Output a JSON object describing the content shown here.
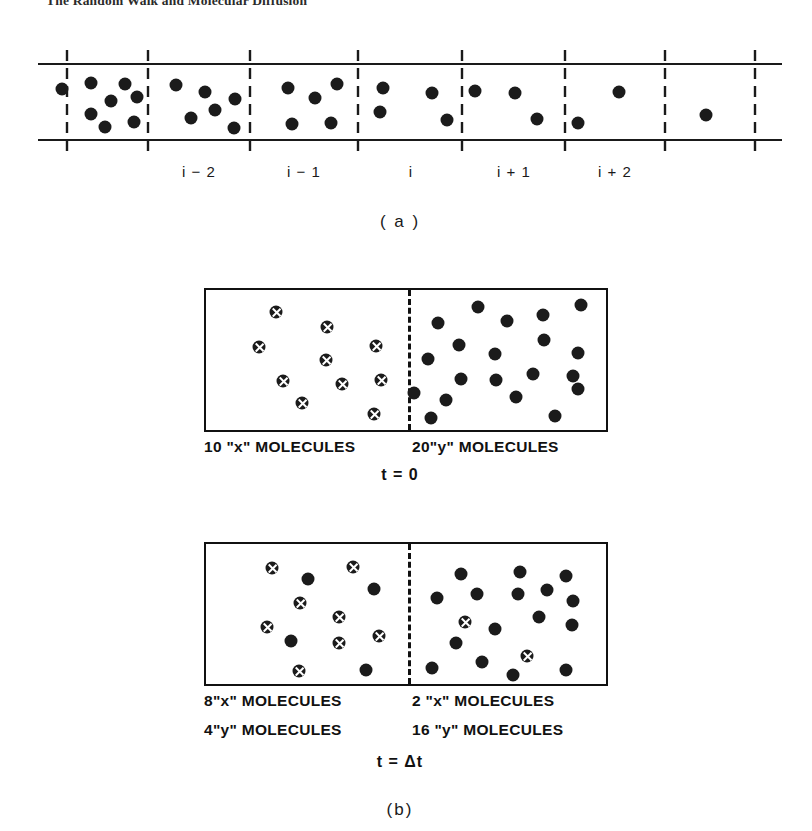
{
  "header": {
    "running_title": "The Random Walk and Molecular Diffusion"
  },
  "figure": {
    "panel_a": {
      "caption": "( a )",
      "caption_x": 400,
      "caption_y": 212,
      "channel": {
        "top_rail_y": 64,
        "bottom_rail_y": 140,
        "x_start": 38,
        "x_end": 782,
        "divider_x": [
          67,
          148,
          250,
          358,
          462,
          565,
          665,
          755
        ],
        "divider_top_y": 50,
        "divider_bottom_y": 155
      },
      "cell_labels": [
        {
          "text": "i − 2",
          "x": 199,
          "y": 163
        },
        {
          "text": "i − 1",
          "x": 304,
          "y": 163
        },
        {
          "text": "i",
          "x": 411,
          "y": 163
        },
        {
          "text": "i + 1",
          "x": 514,
          "y": 163
        },
        {
          "text": "i + 2",
          "x": 615,
          "y": 163
        }
      ],
      "dots": [
        {
          "x": 62,
          "y": 89
        },
        {
          "x": 91,
          "y": 83
        },
        {
          "x": 125,
          "y": 84
        },
        {
          "x": 111,
          "y": 101
        },
        {
          "x": 137,
          "y": 97
        },
        {
          "x": 91,
          "y": 114
        },
        {
          "x": 105,
          "y": 127
        },
        {
          "x": 134,
          "y": 122
        },
        {
          "x": 176,
          "y": 85
        },
        {
          "x": 205,
          "y": 92
        },
        {
          "x": 235,
          "y": 99
        },
        {
          "x": 191,
          "y": 118
        },
        {
          "x": 215,
          "y": 110
        },
        {
          "x": 234,
          "y": 128
        },
        {
          "x": 288,
          "y": 88
        },
        {
          "x": 337,
          "y": 84
        },
        {
          "x": 315,
          "y": 98
        },
        {
          "x": 292,
          "y": 124
        },
        {
          "x": 331,
          "y": 123
        },
        {
          "x": 383,
          "y": 88
        },
        {
          "x": 380,
          "y": 112
        },
        {
          "x": 432,
          "y": 93
        },
        {
          "x": 475,
          "y": 91
        },
        {
          "x": 447,
          "y": 120
        },
        {
          "x": 515,
          "y": 93
        },
        {
          "x": 537,
          "y": 119
        },
        {
          "x": 578,
          "y": 123
        },
        {
          "x": 619,
          "y": 92
        },
        {
          "x": 706,
          "y": 115
        }
      ]
    },
    "panel_b": {
      "caption": "(b)",
      "caption_x": 400,
      "caption_y": 520,
      "boxes": [
        {
          "id": "t0",
          "left": 204,
          "top": 8,
          "width": 404,
          "height": 144,
          "divider_offset": 202,
          "time_label": "t = 0",
          "time_label_x": 400,
          "time_label_y": 186,
          "labels": [
            {
              "text": "10 \"x\" MOLECULES",
              "x": 204,
              "y": 158
            },
            {
              "text": "20\"y\" MOLECULES",
              "x": 412,
              "y": 158
            }
          ],
          "x_molecules": [
            {
              "x": 70,
              "y": 22
            },
            {
              "x": 121,
              "y": 37
            },
            {
              "x": 53,
              "y": 57
            },
            {
              "x": 120,
              "y": 70
            },
            {
              "x": 170,
              "y": 56
            },
            {
              "x": 77,
              "y": 91
            },
            {
              "x": 136,
              "y": 94
            },
            {
              "x": 175,
              "y": 90
            },
            {
              "x": 96,
              "y": 113
            },
            {
              "x": 168,
              "y": 124
            }
          ],
          "y_molecules": [
            {
              "x": 272,
              "y": 17
            },
            {
              "x": 337,
              "y": 25
            },
            {
              "x": 375,
              "y": 15
            },
            {
              "x": 232,
              "y": 33
            },
            {
              "x": 301,
              "y": 31
            },
            {
              "x": 253,
              "y": 55
            },
            {
              "x": 338,
              "y": 50
            },
            {
              "x": 289,
              "y": 64
            },
            {
              "x": 372,
              "y": 63
            },
            {
              "x": 222,
              "y": 69
            },
            {
              "x": 255,
              "y": 89
            },
            {
              "x": 290,
              "y": 90
            },
            {
              "x": 327,
              "y": 84
            },
            {
              "x": 367,
              "y": 86
            },
            {
              "x": 208,
              "y": 103
            },
            {
              "x": 240,
              "y": 110
            },
            {
              "x": 310,
              "y": 107
            },
            {
              "x": 372,
              "y": 99
            },
            {
              "x": 225,
              "y": 128
            },
            {
              "x": 349,
              "y": 126
            }
          ]
        },
        {
          "id": "tdt",
          "left": 204,
          "top": 262,
          "width": 404,
          "height": 144,
          "divider_offset": 202,
          "time_label": "t = Δt",
          "time_label_x": 400,
          "time_label_y": 473,
          "labels": [
            {
              "text": "8\"x\" MOLECULES",
              "x": 204,
              "y": 412
            },
            {
              "text": "2 \"x\" MOLECULES",
              "x": 412,
              "y": 412
            },
            {
              "text": "4\"y\" MOLECULES",
              "x": 204,
              "y": 441
            },
            {
              "text": "16 \"y\" MOLECULES",
              "x": 412,
              "y": 441
            }
          ],
          "x_molecules": [
            {
              "x": 66,
              "y": 24
            },
            {
              "x": 147,
              "y": 23
            },
            {
              "x": 94,
              "y": 59
            },
            {
              "x": 133,
              "y": 73
            },
            {
              "x": 61,
              "y": 83
            },
            {
              "x": 173,
              "y": 92
            },
            {
              "x": 133,
              "y": 99
            },
            {
              "x": 93,
              "y": 127
            },
            {
              "x": 259,
              "y": 78
            },
            {
              "x": 321,
              "y": 112
            }
          ],
          "y_molecules": [
            {
              "x": 102,
              "y": 35
            },
            {
              "x": 168,
              "y": 45
            },
            {
              "x": 85,
              "y": 97
            },
            {
              "x": 160,
              "y": 126
            },
            {
              "x": 255,
              "y": 30
            },
            {
              "x": 314,
              "y": 28
            },
            {
              "x": 360,
              "y": 32
            },
            {
              "x": 231,
              "y": 54
            },
            {
              "x": 271,
              "y": 50
            },
            {
              "x": 312,
              "y": 50
            },
            {
              "x": 341,
              "y": 46
            },
            {
              "x": 367,
              "y": 57
            },
            {
              "x": 333,
              "y": 73
            },
            {
              "x": 289,
              "y": 85
            },
            {
              "x": 366,
              "y": 81
            },
            {
              "x": 250,
              "y": 99
            },
            {
              "x": 276,
              "y": 118
            },
            {
              "x": 226,
              "y": 124
            },
            {
              "x": 307,
              "y": 131
            },
            {
              "x": 360,
              "y": 126
            }
          ]
        }
      ]
    }
  }
}
